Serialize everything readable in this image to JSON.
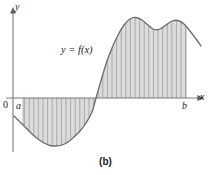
{
  "figure": {
    "caption": "(b)",
    "function_label": "y = f(x)",
    "axis_labels": {
      "y": "y",
      "x": "x",
      "origin": "0",
      "lower_limit": "a",
      "upper_limit": "b"
    },
    "colors": {
      "fill": "#dcdcdc",
      "curve": "#6b6b6b",
      "axis": "#7a7a7a",
      "strip": "#9a9a9a",
      "background": "#ffffff",
      "text": "#1a1a1a"
    }
  },
  "chart_data": {
    "type": "area",
    "title": "",
    "subtitle": "",
    "xlabel": "x",
    "ylabel": "y",
    "legend": [
      "y = f(x)"
    ],
    "grid": false,
    "annotations": [
      "y = f(x)",
      "a",
      "b",
      "0",
      "(b)"
    ],
    "axis_origin_px": {
      "x": 13,
      "y": 98
    },
    "xlim_px": [
      13,
      206
    ],
    "ylim_px": [
      8,
      152
    ],
    "integration_limits": {
      "a_px": 23,
      "b_px": 186
    },
    "curve_points_px": [
      {
        "x": 14,
        "y": 116
      },
      {
        "x": 20,
        "y": 122
      },
      {
        "x": 26,
        "y": 128
      },
      {
        "x": 32,
        "y": 134
      },
      {
        "x": 38,
        "y": 139
      },
      {
        "x": 44,
        "y": 143
      },
      {
        "x": 50,
        "y": 145.5
      },
      {
        "x": 56,
        "y": 146
      },
      {
        "x": 62,
        "y": 145
      },
      {
        "x": 68,
        "y": 142
      },
      {
        "x": 74,
        "y": 137
      },
      {
        "x": 80,
        "y": 131
      },
      {
        "x": 86,
        "y": 123
      },
      {
        "x": 92,
        "y": 112
      },
      {
        "x": 96,
        "y": 98
      },
      {
        "x": 100,
        "y": 84
      },
      {
        "x": 106,
        "y": 64
      },
      {
        "x": 112,
        "y": 48
      },
      {
        "x": 118,
        "y": 35
      },
      {
        "x": 124,
        "y": 25
      },
      {
        "x": 130,
        "y": 19
      },
      {
        "x": 136,
        "y": 17.5
      },
      {
        "x": 142,
        "y": 20
      },
      {
        "x": 148,
        "y": 25
      },
      {
        "x": 154,
        "y": 29.5
      },
      {
        "x": 160,
        "y": 29
      },
      {
        "x": 166,
        "y": 25
      },
      {
        "x": 172,
        "y": 21
      },
      {
        "x": 178,
        "y": 20.5
      },
      {
        "x": 184,
        "y": 24
      },
      {
        "x": 190,
        "y": 31
      },
      {
        "x": 196,
        "y": 39
      },
      {
        "x": 201,
        "y": 46
      }
    ],
    "zero_crossing_px": {
      "x": 96,
      "y": 98
    },
    "minimum_px": {
      "x": 56,
      "y": 146
    },
    "maxima_px": [
      {
        "x": 135,
        "y": 17.5
      },
      {
        "x": 177,
        "y": 20.5
      }
    ],
    "local_dip_px": {
      "x": 157,
      "y": 29.8
    },
    "strip_spacing_px": 4.6,
    "strip_count_negative": 16,
    "strip_count_positive": 21
  }
}
